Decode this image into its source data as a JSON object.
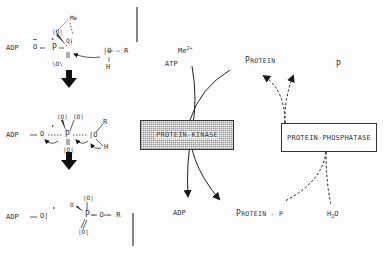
{
  "figure": {
    "left_panel": {
      "title": "Phosphoryl transfer mechanism",
      "step1": {
        "adp": "ADP",
        "bond": "—",
        "bridge_o": "O",
        "p": "P",
        "o_upper": "|O|",
        "o_right": "O|",
        "o_lower": "\\O\\",
        "me": "Me",
        "nucleophile_o": "|O — R",
        "nucleophile_h": "H"
      },
      "step2": {
        "adp": "ADP",
        "bridge_o": "O",
        "p": "P",
        "o_left": "(O)",
        "o_right": "(O)",
        "o_lower": "|O|",
        "ro": "|O",
        "r": "R",
        "h": "H"
      },
      "step3": {
        "adp": "ADP",
        "leaving_o": "O|",
        "p": "P",
        "o_top": "|O|",
        "o_left": "O",
        "o_lower": "|O|",
        "ester": "— O — R"
      }
    },
    "kinase_cycle": {
      "mg_label": "Me",
      "mg_charge": "2+",
      "atp_label": "ATP",
      "protein_label_cap": "P",
      "protein_label_rest": "ROTEIN",
      "enzyme_label": "PROTEIN-KINASE",
      "adp_label": "ADP",
      "protein_p_label_cap": "P",
      "protein_p_label_rest": "ROTEIN - P"
    },
    "phosphatase_cycle": {
      "enzyme_label": "PROTEIN-PHOSPHATASE",
      "p_label": "P",
      "h2o_label": "H",
      "h2o_sub": "2",
      "h2o_o": "O"
    },
    "colors": {
      "ink": "#2a2a2a",
      "paper": "#fdfdfd",
      "stipple": "#bdbdbd"
    }
  }
}
